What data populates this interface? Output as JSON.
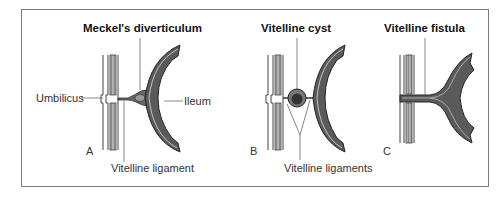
{
  "figure": {
    "panels": [
      {
        "letter": "A",
        "title": "Meckel's diverticulum",
        "labels": {
          "umbilicus": "Umbilicus",
          "ileum": "Ileum",
          "ligament": "Vitelline ligament"
        }
      },
      {
        "letter": "B",
        "title": "Vitelline cyst",
        "labels": {
          "ligaments": "Vitelline ligaments"
        }
      },
      {
        "letter": "C",
        "title": "Vitelline fistula",
        "labels": {}
      }
    ],
    "colors": {
      "frame": "#7a7a7a",
      "intestine_fill": "#5a5a5a",
      "intestine_outline": "#333333",
      "wall_stripe": "#9a9a9a",
      "leader_line": "#555555"
    }
  }
}
